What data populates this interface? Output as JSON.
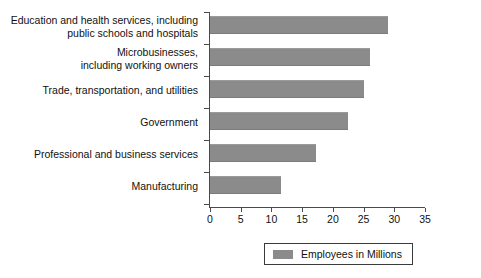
{
  "chart_data": {
    "type": "bar",
    "orientation": "horizontal",
    "title": "",
    "subtitle": "",
    "xlabel": "",
    "ylabel": "",
    "xlim": [
      0,
      35
    ],
    "xticks": [
      0,
      5,
      10,
      15,
      20,
      25,
      30,
      35
    ],
    "xtick_labels": [
      "0",
      "5",
      "10",
      "15",
      "20",
      "25",
      "30",
      "35"
    ],
    "grid": false,
    "legend_position": "bottom",
    "bar_color": "#8b8b8b",
    "axis_color": "#4a4a4a",
    "categories": [
      "Education and health services, including\npublic schools and hospitals",
      "Microbusinesses,\nincluding working owners",
      "Trade, transportation, and utilities",
      "Government",
      "Professional and business services",
      "Manufacturing"
    ],
    "series": [
      {
        "name": "Employees in Millions",
        "values": [
          29,
          26,
          25,
          22.5,
          17.2,
          11.6
        ]
      }
    ],
    "legend": [
      {
        "label": "Employees in Millions",
        "color": "#8b8b8b"
      }
    ]
  }
}
